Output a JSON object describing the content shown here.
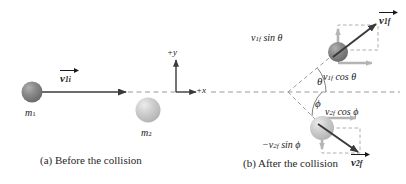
{
  "figure": {
    "background_color": "#ffffff"
  },
  "colors": {
    "ball_dark": "#7d7d7d",
    "ball_dark_highlight": "#a8a8a8",
    "ball_light": "#c6c6c6",
    "ball_light_highlight": "#e4e4e4",
    "vector_dark": "#3a3a3a",
    "component_gray": "#b4b4b4",
    "dashed_gray": "#9a9a9a",
    "text": "#1a1a1a"
  },
  "panel_a": {
    "caption": "(a) Before the collision",
    "ball1": {
      "label": "m",
      "sub": "1",
      "fill": "#7d7d7d"
    },
    "ball2": {
      "label": "m",
      "sub": "2",
      "fill": "#c6c6c6"
    },
    "velocity_vector": {
      "symbol": "v",
      "sub": "1i",
      "bold": true
    },
    "axis_x_label": "+x",
    "axis_y_label": "+y"
  },
  "panel_b": {
    "caption": "(b) After the collision",
    "ball1": {
      "fill": "#7d7d7d"
    },
    "ball2": {
      "fill": "#c6c6c6"
    },
    "vector_1f": {
      "symbol": "v",
      "sub": "1f",
      "bold": true
    },
    "vector_2f": {
      "symbol": "v",
      "sub": "2f",
      "bold": true
    },
    "component_1_y": {
      "text": "v",
      "sub": "1f",
      "trig": " sin θ"
    },
    "component_1_x": {
      "text": "v",
      "sub": "1f",
      "trig": " cos θ"
    },
    "component_2_x": {
      "text": "v",
      "sub": "2f",
      "trig": " cos ϕ"
    },
    "component_2_y": {
      "prefix": "−v",
      "sub": "2f",
      "trig": " sin ϕ"
    },
    "angle_theta": "θ",
    "angle_phi": "ϕ"
  }
}
